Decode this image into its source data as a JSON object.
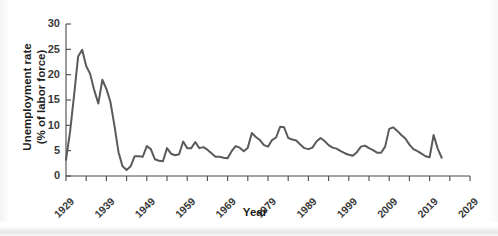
{
  "chart_data": {
    "type": "line",
    "title": "",
    "subtitle": "",
    "xlabel": "Year",
    "ylabel": "Unemployment rate\n(% of labor force)",
    "ylabel_line1": "Unemployment rate",
    "ylabel_line2": "(% of labor force)",
    "grid": false,
    "legend": "none",
    "xlim": [
      1929,
      2029
    ],
    "ylim": [
      0,
      30
    ],
    "y_ticks": [
      0,
      5,
      10,
      15,
      20,
      25,
      30
    ],
    "y_tick_labels": [
      "0",
      "5",
      "10",
      "15",
      "20",
      "25",
      "30"
    ],
    "x_ticks": [
      1929,
      1934,
      1939,
      1944,
      1949,
      1954,
      1959,
      1964,
      1969,
      1974,
      1979,
      1984,
      1989,
      1994,
      1999,
      2004,
      2009,
      2014,
      2019,
      2024,
      2029
    ],
    "x_tick_labels_shown": [
      "1929",
      "1939",
      "1949",
      "1959",
      "1969",
      "1979",
      "1989",
      "1999",
      "2009",
      "2019",
      "2029"
    ],
    "x_tick_label_interval": 10,
    "line_color": "#5a5a5a",
    "axis_color": "#4a4a4a",
    "background_color": "#ffffff",
    "series": [
      {
        "name": "Unemployment rate",
        "x": [
          1929,
          1930,
          1931,
          1932,
          1933,
          1934,
          1935,
          1936,
          1937,
          1938,
          1939,
          1940,
          1941,
          1942,
          1943,
          1944,
          1945,
          1946,
          1947,
          1948,
          1949,
          1950,
          1951,
          1952,
          1953,
          1954,
          1955,
          1956,
          1957,
          1958,
          1959,
          1960,
          1961,
          1962,
          1963,
          1964,
          1965,
          1966,
          1967,
          1968,
          1969,
          1970,
          1971,
          1972,
          1973,
          1974,
          1975,
          1976,
          1977,
          1978,
          1979,
          1980,
          1981,
          1982,
          1983,
          1984,
          1985,
          1986,
          1987,
          1988,
          1989,
          1990,
          1991,
          1992,
          1993,
          1994,
          1995,
          1996,
          1997,
          1998,
          1999,
          2000,
          2001,
          2002,
          2003,
          2004,
          2005,
          2006,
          2007,
          2008,
          2009,
          2010,
          2011,
          2012,
          2013,
          2014,
          2015,
          2016,
          2017,
          2018,
          2019,
          2020,
          2021,
          2022
        ],
        "values": [
          3.2,
          8.7,
          15.9,
          23.6,
          24.9,
          21.7,
          20.1,
          16.9,
          14.3,
          19.0,
          17.2,
          14.6,
          9.9,
          4.7,
          1.9,
          1.2,
          1.9,
          3.9,
          3.9,
          3.8,
          5.9,
          5.3,
          3.3,
          3.0,
          2.9,
          5.5,
          4.4,
          4.1,
          4.3,
          6.8,
          5.5,
          5.5,
          6.7,
          5.5,
          5.7,
          5.2,
          4.5,
          3.8,
          3.8,
          3.6,
          3.5,
          4.9,
          5.9,
          5.6,
          4.9,
          5.6,
          8.5,
          7.7,
          7.1,
          6.1,
          5.8,
          7.1,
          7.6,
          9.7,
          9.6,
          7.5,
          7.2,
          7.0,
          6.2,
          5.5,
          5.3,
          5.6,
          6.8,
          7.5,
          6.9,
          6.1,
          5.6,
          5.4,
          4.9,
          4.5,
          4.2,
          4.0,
          4.7,
          5.8,
          6.0,
          5.5,
          5.1,
          4.6,
          4.6,
          5.8,
          9.3,
          9.6,
          8.9,
          8.1,
          7.4,
          6.2,
          5.3,
          4.9,
          4.4,
          3.9,
          3.7,
          8.1,
          5.4,
          3.6
        ]
      }
    ],
    "annotations": []
  }
}
